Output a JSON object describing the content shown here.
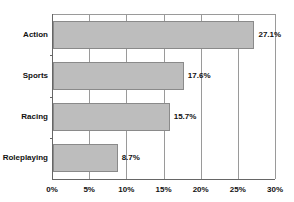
{
  "chart_data": {
    "type": "bar",
    "orientation": "horizontal",
    "title": "",
    "xlabel": "",
    "ylabel": "",
    "categories": [
      "Action",
      "Sports",
      "Racing",
      "Roleplaying"
    ],
    "values": [
      27.1,
      17.6,
      15.7,
      8.7
    ],
    "value_labels": [
      "27.1%",
      "17.6%",
      "15.7%",
      "8.7%"
    ],
    "xlim": [
      0,
      30
    ],
    "x_ticks": [
      "0%",
      "5%",
      "10%",
      "15%",
      "20%",
      "25%",
      "30%"
    ],
    "grid": true,
    "legend": null,
    "bar_color": "#bdbdbd"
  }
}
